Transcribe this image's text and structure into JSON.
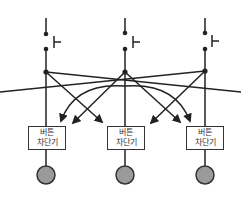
{
  "diagram": {
    "type": "circuit-blocking-diagram",
    "colors": {
      "line": "#222222",
      "indicator_fill": "#9a9a9a",
      "indicator_stroke": "#333333"
    },
    "boxes": [
      {
        "line1": "버튼",
        "line2": "차단기"
      },
      {
        "line1": "버튼",
        "line2": "차단기"
      },
      {
        "line1": "버튼",
        "line2": "차단기"
      }
    ],
    "switch_glyph": "push-button-switch",
    "indicator_glyph": "gray-circle"
  }
}
